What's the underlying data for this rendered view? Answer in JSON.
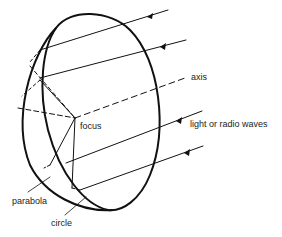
{
  "diagram": {
    "labels": {
      "axis": "axis",
      "focus": "focus",
      "waves": "light or radio waves",
      "parabola": "parabola",
      "circle": "circle"
    },
    "colors": {
      "stroke": "#111111",
      "text": "#222222",
      "background": "#ffffff"
    },
    "rays": [
      {
        "name": "ray-1"
      },
      {
        "name": "ray-2"
      },
      {
        "name": "ray-3"
      },
      {
        "name": "ray-4"
      }
    ]
  }
}
